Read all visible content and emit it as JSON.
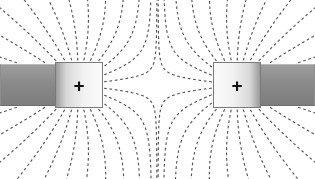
{
  "figure": {
    "name": "electric-field-two-like-charges",
    "width": 315,
    "height": 179,
    "background_color": "#ffffff"
  },
  "colors": {
    "field_line": "#555555",
    "lead_bar_dark": "#8a8a8a",
    "lead_bar_dark_edge": "#6f6f6f",
    "block_light": "#f2f2f2",
    "block_shadow": "#9a9a9a",
    "block_border": "#7a7a7a",
    "sign_color": "#111111"
  },
  "charges": [
    {
      "id": "left-charge",
      "label": "+",
      "polarity": "positive",
      "center_x": 78,
      "center_y": 85,
      "block": {
        "x": 55,
        "y": 62,
        "width": 48,
        "height": 46
      },
      "lead_bar": {
        "x": 0,
        "y": 64,
        "width": 56,
        "height": 42
      },
      "lead_side": "left"
    },
    {
      "id": "right-charge",
      "label": "+",
      "polarity": "positive",
      "center_x": 237,
      "center_y": 85,
      "block": {
        "x": 213,
        "y": 62,
        "width": 48,
        "height": 46
      },
      "lead_bar": {
        "x": 260,
        "y": 64,
        "width": 55,
        "height": 42
      },
      "lead_side": "right"
    }
  ],
  "field": {
    "style": "dashed",
    "dash_length": 2.1,
    "gap_length": 2.1,
    "line_width": 1.15,
    "color": "#555555",
    "lines_per_charge": 26,
    "saddle_point": {
      "x": 157.5,
      "y": 85
    },
    "description": "Dashed electric field lines radiating from two equal positive point charges, forming a saddle point midway between them."
  }
}
